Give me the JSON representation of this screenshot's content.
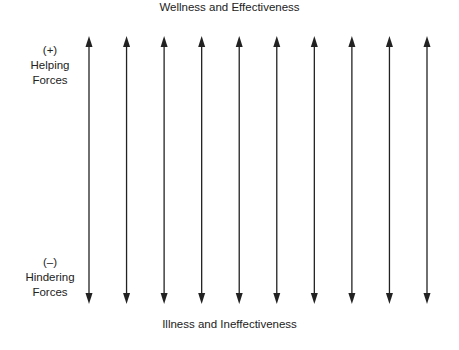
{
  "diagram": {
    "top_label": "Wellness and Effectiveness",
    "bottom_label": "Illness and Ineffectiveness",
    "helping": {
      "sign": "(+)",
      "line1": "Helping",
      "line2": "Forces"
    },
    "hindering": {
      "sign": "(–)",
      "line1": "Hindering",
      "line2": "Forces"
    },
    "arrow_count": 10,
    "arrow_color": "#222222"
  }
}
